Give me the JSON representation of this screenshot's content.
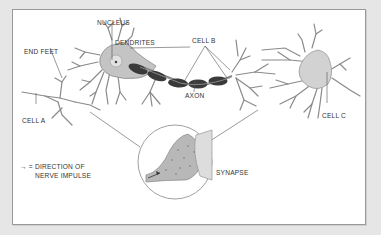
{
  "diagram": {
    "type": "neuron-anatomy",
    "labels": {
      "nucleus": "NUCLEUS",
      "dendrites": "DENDRITES",
      "end_feet": "END FEET",
      "cell_a": "CELL A",
      "cell_b": "CELL B",
      "cell_c": "CELL C",
      "axon": "AXON",
      "synapse": "SYNAPSE"
    },
    "legend": {
      "symbol": "→ =",
      "line1": "DIRECTION OF",
      "line2": "NERVE IMPULSE"
    },
    "colors": {
      "background": "#e6e6e6",
      "panel": "#ffffff",
      "cell_fill": "#c9c9c9",
      "myelin": "#3a3a3a",
      "line": "#555555"
    }
  }
}
